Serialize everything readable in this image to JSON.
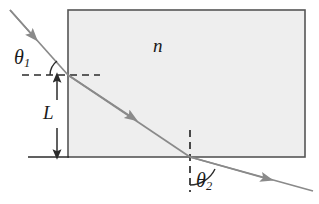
{
  "figure": {
    "background_color": "#ffffff",
    "ink_color": "#2b2b2b",
    "ray_color": "#8a8a8a",
    "medium_fill": "#eeeeee",
    "medium_border": "#555555"
  },
  "labels": {
    "incident_angle": "θ",
    "incident_angle_sub": "1",
    "refracted_angle": "θ",
    "refracted_angle_sub": "2",
    "thickness": "L",
    "refractive_index": "n"
  },
  "geometry": {
    "medium_rect": {
      "x": 68,
      "y": 10,
      "width": 237,
      "height": 147
    },
    "entry_point": {
      "x": 68,
      "y": 75
    },
    "exit_point": {
      "x": 190,
      "y": 157
    },
    "incident_ray_start": {
      "x": 10,
      "y": 10
    },
    "exit_ray_end": {
      "x": 312,
      "y": 190
    },
    "normal_dashed_horizontal": {
      "x1": 22,
      "y1": 75,
      "x2": 100,
      "y2": 75
    },
    "normal_dashed_vertical": {
      "x1": 190,
      "y1": 130,
      "x2": 190,
      "y2": 192
    },
    "baseline_left": {
      "x1": 28,
      "y1": 157,
      "x2": 68,
      "y2": 157
    },
    "thickness_arrow": {
      "x": 57,
      "y_top": 77,
      "y_bottom": 155
    }
  },
  "elements": {
    "medium_block": "medium-block",
    "incident_ray": "incident-ray",
    "internal_ray": "internal-ray",
    "exit_ray": "exit-ray",
    "angle_arc_1": "angle-arc-theta1",
    "angle_arc_2": "angle-arc-theta2"
  }
}
